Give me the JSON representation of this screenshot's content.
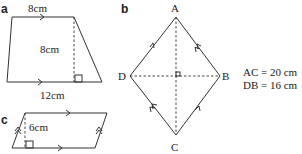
{
  "figures": {
    "a": {
      "label": "a",
      "shape": "trapezium",
      "top": "8cm",
      "height": "8cm",
      "bottom": "12cm"
    },
    "b": {
      "label": "b",
      "shape": "kite/rhombus",
      "vertices": {
        "top": "A",
        "right": "B",
        "bottom": "C",
        "left": "D"
      },
      "facts": [
        "AC = 20 cm",
        "DB = 16 cm"
      ]
    },
    "c": {
      "label": "c",
      "shape": "parallelogram",
      "height": "6cm"
    }
  },
  "colors": {
    "line": "#333333",
    "text": "#222222"
  }
}
